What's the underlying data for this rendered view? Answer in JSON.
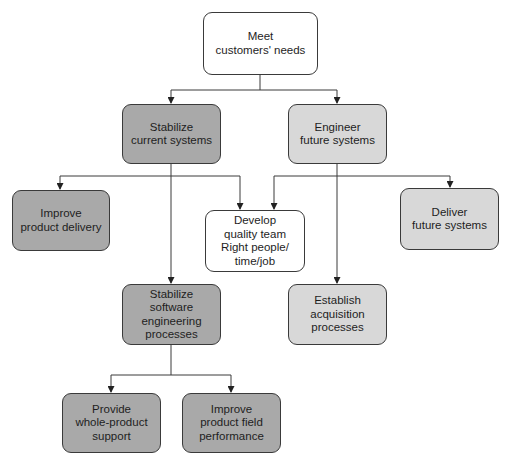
{
  "colors": {
    "dark_node": "#a9a9a9",
    "light_node": "#d8d8d8",
    "white_node": "#ffffff",
    "line": "#3a3a3a"
  },
  "nodes": {
    "root": {
      "lines": [
        "Meet",
        "customers' needs"
      ],
      "fill": "white"
    },
    "stabilize_current": {
      "lines": [
        "Stabilize",
        "current systems"
      ],
      "fill": "dark"
    },
    "engineer_future": {
      "lines": [
        "Engineer",
        "future systems"
      ],
      "fill": "light"
    },
    "improve_delivery": {
      "lines": [
        "Improve",
        "product delivery"
      ],
      "fill": "dark"
    },
    "develop_team": {
      "lines": [
        "Develop",
        "quality team",
        "Right people/",
        "time/job"
      ],
      "fill": "white"
    },
    "deliver_future": {
      "lines": [
        "Deliver",
        "future systems"
      ],
      "fill": "light"
    },
    "stabilize_software": {
      "lines": [
        "Stabilize",
        "software",
        "engineering",
        "processes"
      ],
      "fill": "dark"
    },
    "establish_acquisition": {
      "lines": [
        "Establish",
        "acquisition",
        "processes"
      ],
      "fill": "light"
    },
    "provide_support": {
      "lines": [
        "Provide",
        "whole-product",
        "support"
      ],
      "fill": "dark"
    },
    "improve_field": {
      "lines": [
        "Improve",
        "product field",
        "performance"
      ],
      "fill": "dark"
    }
  },
  "edges": [
    [
      "root",
      "stabilize_current"
    ],
    [
      "root",
      "engineer_future"
    ],
    [
      "stabilize_current",
      "improve_delivery"
    ],
    [
      "stabilize_current",
      "develop_team"
    ],
    [
      "stabilize_current",
      "stabilize_software"
    ],
    [
      "engineer_future",
      "develop_team"
    ],
    [
      "engineer_future",
      "deliver_future"
    ],
    [
      "engineer_future",
      "establish_acquisition"
    ],
    [
      "stabilize_software",
      "provide_support"
    ],
    [
      "stabilize_software",
      "improve_field"
    ]
  ]
}
